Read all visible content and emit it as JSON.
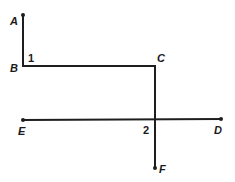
{
  "diagram": {
    "type": "geometry",
    "points": {
      "A": {
        "label": "A",
        "x": 23,
        "y": 15
      },
      "B": {
        "label": "B",
        "x": 23,
        "y": 66
      },
      "C": {
        "label": "C",
        "x": 155,
        "y": 66
      },
      "D": {
        "label": "D",
        "x": 221,
        "y": 119
      },
      "E": {
        "label": "E",
        "x": 23,
        "y": 120
      },
      "F": {
        "label": "F",
        "x": 155,
        "y": 168
      }
    },
    "angles": {
      "angle1": {
        "label": "1"
      },
      "angle2": {
        "label": "2"
      }
    },
    "segments": [
      {
        "from": "A",
        "to": "B"
      },
      {
        "from": "B",
        "to": "C"
      },
      {
        "from": "C",
        "to": "F"
      },
      {
        "from": "E",
        "to": "D"
      }
    ],
    "colors": {
      "stroke": "#1e1e1e",
      "background": "#ffffff"
    }
  }
}
